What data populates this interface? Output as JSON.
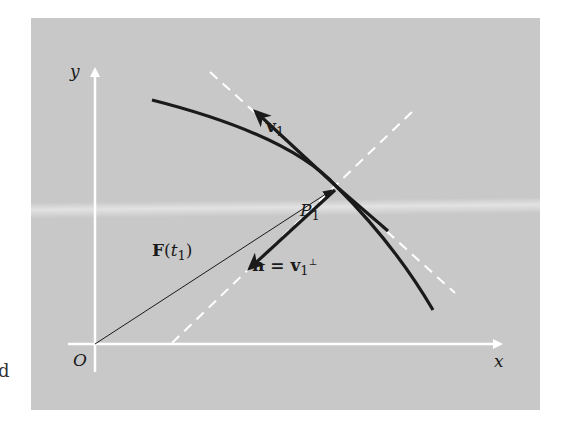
{
  "diagram": {
    "title": "",
    "colors": {
      "background": "#c8c8c8",
      "axes": "#ffffff",
      "curve": "#1a1a1a",
      "dashed_lines": "#ffffff",
      "vectors": "#1a1a1a"
    },
    "axes": {
      "x_label": "x",
      "y_label": "y",
      "origin_label": "O"
    },
    "labels": {
      "tangent_vector": "v",
      "tangent_vector_sub": "1",
      "point": "P",
      "point_sub": "1",
      "position_vector": "F",
      "position_vector_arg_open": "(",
      "position_vector_arg": "t",
      "position_vector_arg_sub": "1",
      "position_vector_arg_close": ")",
      "normal_vector_lhs": "n",
      "normal_vector_eq": " = ",
      "normal_vector_rhs": "v",
      "normal_vector_rhs_sub": "1",
      "normal_vector_rhs_sup": "⊥"
    },
    "elements": [
      "curve through P1",
      "dashed tangent line at P1",
      "dashed normal line at P1",
      "tangent vector v1 from P1",
      "normal vector n from P1",
      "position vector F(t1) from O to P1"
    ],
    "side_glyph": "d"
  }
}
